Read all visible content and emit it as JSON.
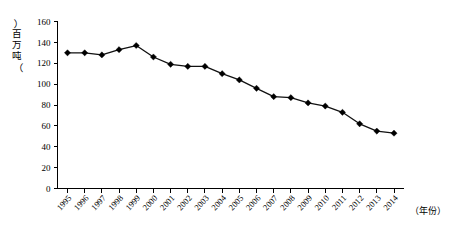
{
  "chart_data": {
    "type": "line",
    "title": "",
    "subtitle": "",
    "xlabel": "（年份）",
    "ylabel": "（百万吨）",
    "ylim": [
      0,
      160
    ],
    "ytick_step": 20,
    "yticks": [
      0,
      20,
      40,
      60,
      80,
      100,
      120,
      140,
      160
    ],
    "grid": false,
    "legend": null,
    "marker": "diamond",
    "categories": [
      "1995",
      "1996",
      "1997",
      "1998",
      "1999",
      "2000",
      "2001",
      "2002",
      "2003",
      "2004",
      "2005",
      "2006",
      "2007",
      "2008",
      "2009",
      "2010",
      "2011",
      "2012",
      "2013",
      "2014"
    ],
    "values": [
      130,
      130,
      128,
      133,
      137,
      126,
      119,
      117,
      117,
      110,
      104,
      96,
      88,
      87,
      82,
      79,
      73,
      62,
      55,
      53
    ],
    "series": [
      {
        "name": "产量",
        "values": [
          130,
          130,
          128,
          133,
          137,
          126,
          119,
          117,
          117,
          110,
          104,
          96,
          88,
          87,
          82,
          79,
          73,
          62,
          55,
          53
        ]
      }
    ],
    "annotations": []
  },
  "axis": {
    "y_unit_label": "（百万吨）",
    "y_unit_chars": [
      "百",
      "万",
      "吨"
    ],
    "x_unit_label": "（年份）"
  },
  "colors": {
    "axis": "#000000",
    "line": "#111111",
    "marker": "#000000",
    "background": "#ffffff"
  }
}
